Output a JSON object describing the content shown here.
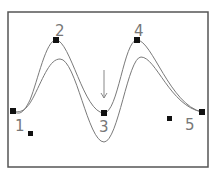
{
  "diagram": {
    "type": "spline-control-points",
    "colors": {
      "frame": "#555555",
      "curve": "#7a7a7a",
      "point": "#111111",
      "label": "#777777",
      "arrow": "#888888"
    },
    "control_points": [
      {
        "label": "1",
        "x": 13,
        "y": 111
      },
      {
        "label": "2",
        "x": 56,
        "y": 40
      },
      {
        "label": "3",
        "x": 104,
        "y": 113
      },
      {
        "label": "4",
        "x": 137,
        "y": 40
      },
      {
        "label": "5",
        "x": 202,
        "y": 112
      }
    ],
    "extra_points": [
      {
        "x": 30,
        "y": 133
      },
      {
        "x": 169,
        "y": 118
      }
    ],
    "labels": [
      {
        "text": "1",
        "x": 16,
        "y": 131
      },
      {
        "text": "2",
        "x": 57,
        "y": 36
      },
      {
        "text": "3",
        "x": 99,
        "y": 132
      },
      {
        "text": "4",
        "x": 136,
        "y": 36
      },
      {
        "text": "5",
        "x": 186,
        "y": 130
      }
    ],
    "arrow": {
      "direction": "down",
      "x": 104,
      "y1": 70,
      "y2": 98
    }
  }
}
